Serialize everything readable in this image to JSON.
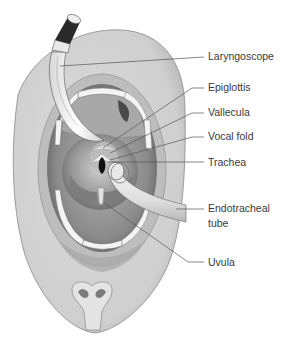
{
  "figure": {
    "labels": [
      {
        "id": "laryngoscope",
        "text": "Laryngoscope",
        "x": 208,
        "y": 60,
        "line": [
          [
            60,
            66
          ],
          [
            204,
            57
          ]
        ]
      },
      {
        "id": "epiglottis",
        "text": "Epiglottis",
        "x": 208,
        "y": 91,
        "line": [
          [
            103,
            148
          ],
          [
            192,
            88
          ],
          [
            204,
            88
          ]
        ]
      },
      {
        "id": "vallecula",
        "text": "Vallecula",
        "x": 208,
        "y": 116,
        "line": [
          [
            110,
            153
          ],
          [
            192,
            113
          ],
          [
            204,
            113
          ]
        ]
      },
      {
        "id": "vocal-fold",
        "text": "Vocal fold",
        "x": 208,
        "y": 140,
        "line": [
          [
            110,
            160
          ],
          [
            192,
            137
          ],
          [
            204,
            137
          ]
        ]
      },
      {
        "id": "trachea",
        "text": "Trachea",
        "x": 208,
        "y": 166,
        "line": [
          [
            108,
            162
          ],
          [
            204,
            162
          ]
        ]
      },
      {
        "id": "endotracheal-tube",
        "text": "Endotracheal",
        "text2": "tube",
        "x": 208,
        "y": 212,
        "y2": 227,
        "line": [
          [
            176,
            209
          ],
          [
            204,
            209
          ]
        ]
      },
      {
        "id": "uvula",
        "text": "Uvula",
        "x": 208,
        "y": 266,
        "line": [
          [
            104,
            203
          ],
          [
            188,
            262
          ],
          [
            204,
            262
          ]
        ]
      }
    ]
  },
  "colors": {
    "face": "#d6d6d6",
    "face_edge": "#7a7a7a",
    "mouth_dark": "#6e6e6e",
    "throat": "#9a9a9a",
    "teeth": "#f4f4f4",
    "scope": "#f2f2f2",
    "scope_handle": "#2a2a2a",
    "tube": "#eaeaea",
    "label_text": "#3a3a3a"
  }
}
